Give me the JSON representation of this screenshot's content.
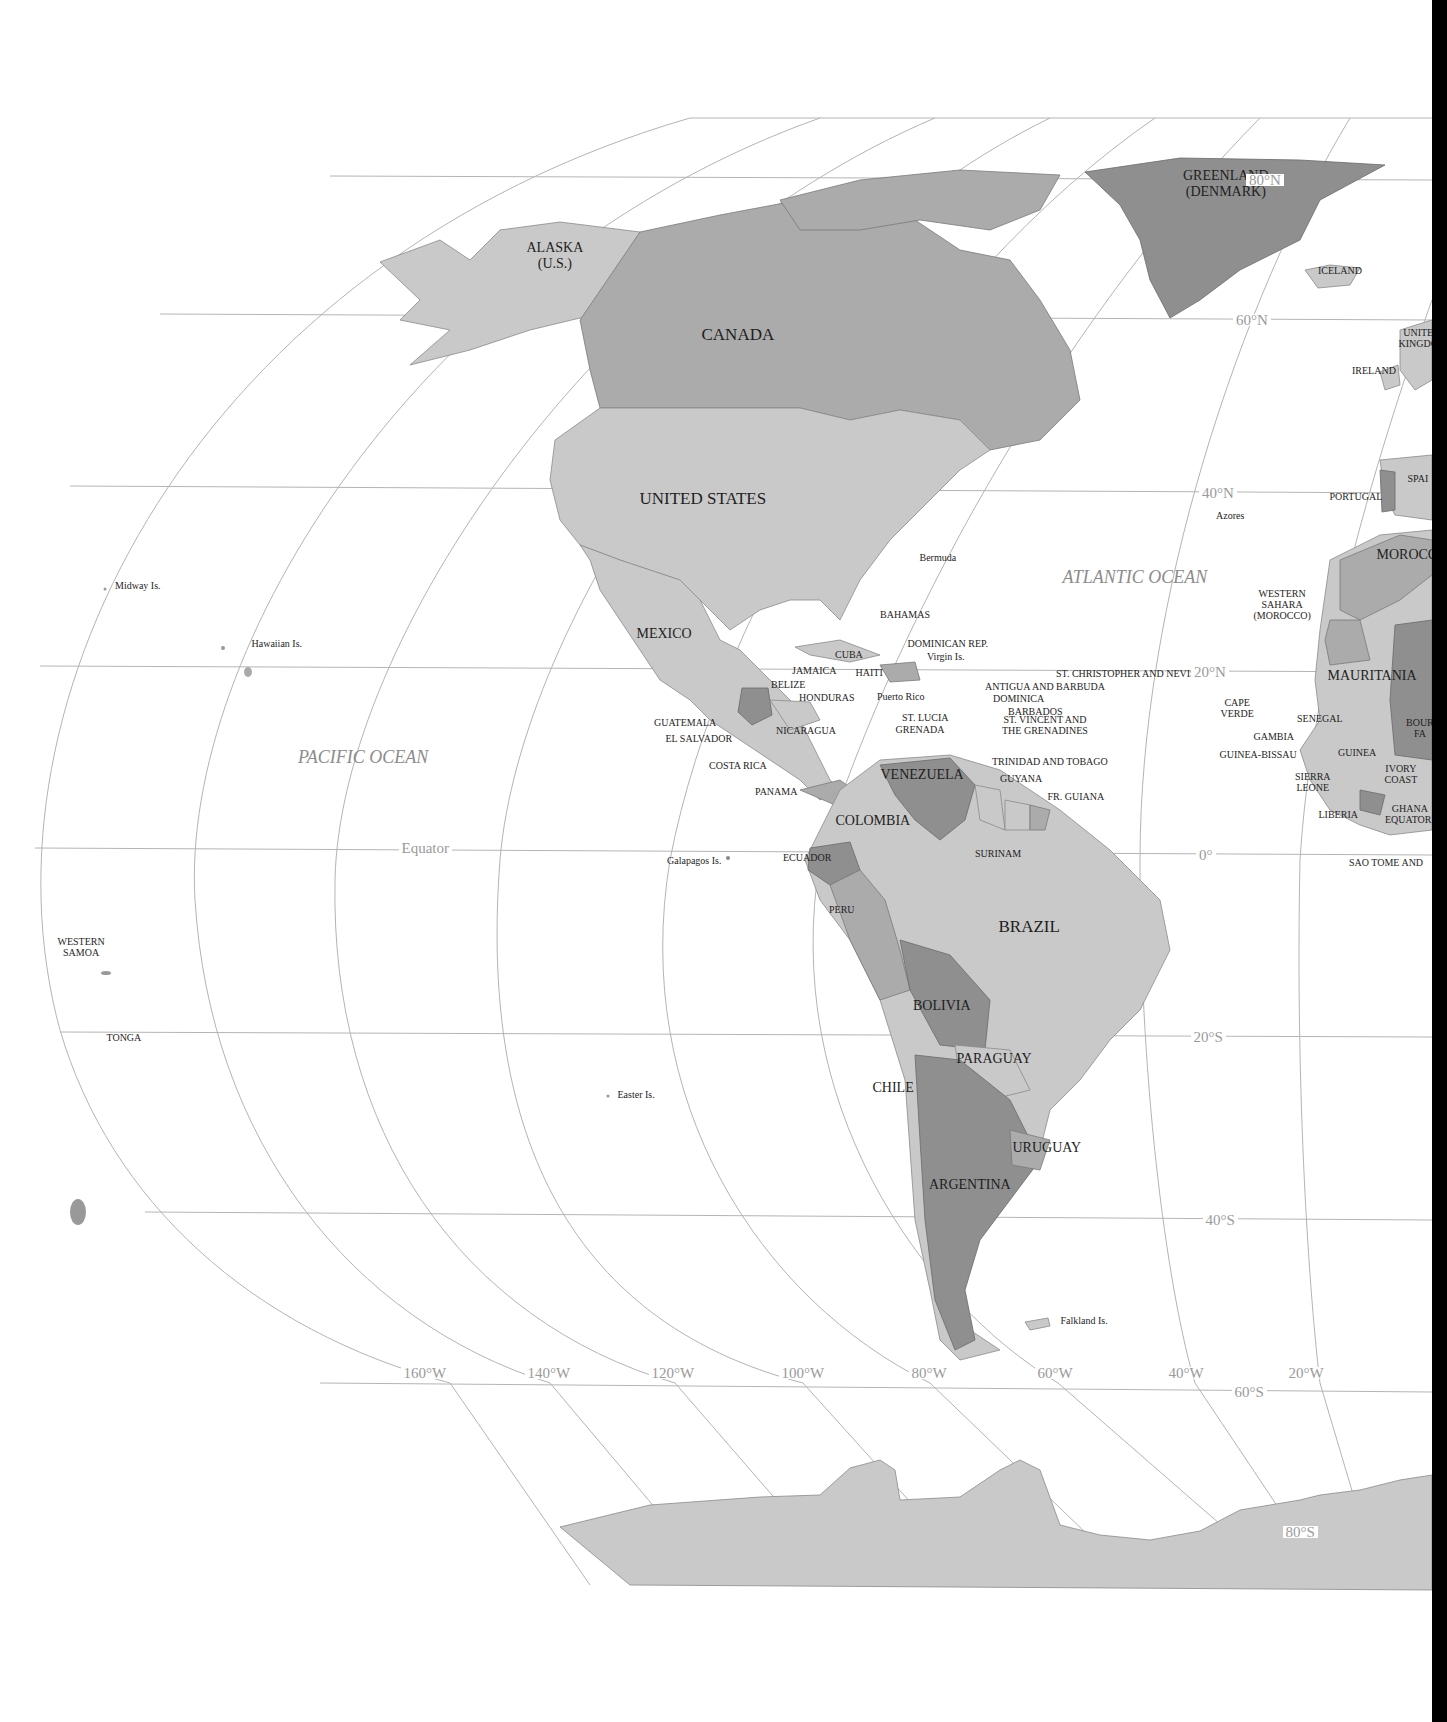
{
  "map": {
    "title": "Western Hemisphere political map",
    "colors": {
      "light": "#c9c9c9",
      "medium": "#ababab",
      "dark": "#8f8f8f",
      "grid": "#b4b4b4",
      "ocean_label": "#8c8c8c",
      "background": "#ffffff"
    },
    "oceans": [
      "PACIFIC OCEAN",
      "ATLANTIC OCEAN"
    ],
    "latitude_labels": [
      "80°N",
      "60°N",
      "40°N",
      "20°N",
      "Equator",
      "0°",
      "20°S",
      "40°S",
      "60°S",
      "80°S"
    ],
    "longitude_labels": [
      "160°W",
      "140°W",
      "120°W",
      "100°W",
      "80°W",
      "60°W",
      "40°W",
      "20°W"
    ],
    "countries": {
      "north_america": [
        "ALASKA\n(U.S.)",
        "CANADA",
        "UNITED STATES",
        "MEXICO",
        "GREENLAND\n(DENMARK)"
      ],
      "central_america": [
        "BELIZE",
        "HONDURAS",
        "GUATEMALA",
        "EL SALVADOR",
        "NICARAGUA",
        "COSTA RICA",
        "PANAMA"
      ],
      "caribbean": [
        "BAHAMAS",
        "CUBA",
        "JAMAICA",
        "HAITI",
        "DOMINICAN REP.",
        "Virgin Is.",
        "Puerto Rico",
        "ST. CHRISTOPHER AND NEVIS",
        "ANTIGUA AND BARBUDA",
        "DOMINICA",
        "BARBADOS",
        "ST. LUCIA",
        "GRENADA",
        "ST. VINCENT AND\nTHE GRENADINES",
        "TRINIDAD AND TOBAGO"
      ],
      "south_america": [
        "VENEZUELA",
        "GUYANA",
        "FR. GUIANA",
        "SURINAM",
        "COLOMBIA",
        "ECUADOR",
        "PERU",
        "BRAZIL",
        "BOLIVIA",
        "PARAGUAY",
        "CHILE",
        "URUGUAY",
        "ARGENTINA"
      ],
      "europe_africa": [
        "ICELAND",
        "UNITED\nKINGDOM",
        "IRELAND",
        "SPAIN",
        "PORTUGAL",
        "MOROCCO",
        "WESTERN\nSAHARA\n(MOROCCO)",
        "MAURITANIA",
        "CAPE\nVERDE",
        "SENEGAL",
        "GAMBIA",
        "GUINEA-BISSAU",
        "GUINEA",
        "BOURKINA\nFASO",
        "SIERRA\nLEONE",
        "LIBERIA",
        "IVORY\nCOAST",
        "GHANA",
        "EQUATORIAL",
        "SAO TOME AND"
      ]
    },
    "islands": [
      "Midway Is.",
      "Hawaiian Is.",
      "WESTERN\nSAMOA",
      "TONGA",
      "Galapagos Is.",
      "Easter Is.",
      "Falkland Is.",
      "Bermuda",
      "Azores"
    ],
    "labels": [
      {
        "id": "alaska",
        "t": "ALASKA",
        "t2": "(U.S.)",
        "x": 555,
        "y": 256,
        "cls": "med"
      },
      {
        "id": "canada",
        "t": "CANADA",
        "x": 738,
        "y": 334,
        "cls": "big"
      },
      {
        "id": "united-states",
        "t": "UNITED STATES",
        "x": 703,
        "y": 498,
        "cls": "big"
      },
      {
        "id": "mexico",
        "t": "MEXICO",
        "x": 664,
        "y": 634,
        "cls": "med"
      },
      {
        "id": "greenland",
        "t": "GREENLAND",
        "t2": "(DENMARK)",
        "x": 1226,
        "y": 184,
        "cls": "med"
      },
      {
        "id": "iceland",
        "t": "ICELAND",
        "x": 1340,
        "y": 270,
        "cls": "small"
      },
      {
        "id": "united-kingdom",
        "t": "UNITE",
        "t2": "KINGDO",
        "x": 1418,
        "y": 338,
        "cls": "small"
      },
      {
        "id": "ireland",
        "t": "IRELAND",
        "x": 1374,
        "y": 370,
        "cls": "small"
      },
      {
        "id": "spain",
        "t": "SPAI",
        "x": 1418,
        "y": 478,
        "cls": "small"
      },
      {
        "id": "portugal",
        "t": "PORTUGAL",
        "x": 1356,
        "y": 496,
        "cls": "small"
      },
      {
        "id": "morocco",
        "t": "MOROCCO",
        "x": 1412,
        "y": 555,
        "cls": "med"
      },
      {
        "id": "western-sahara",
        "t": "WESTERN",
        "t2": "SAHARA",
        "t3": "(MOROCCO)",
        "x": 1282,
        "y": 604,
        "cls": "small"
      },
      {
        "id": "mauritania",
        "t": "MAURITANIA",
        "x": 1372,
        "y": 676,
        "cls": "med"
      },
      {
        "id": "cape-verde",
        "t": "CAPE",
        "t2": "VERDE",
        "x": 1237,
        "y": 708,
        "cls": "small"
      },
      {
        "id": "senegal",
        "t": "SENEGAL",
        "x": 1320,
        "y": 718,
        "cls": "small"
      },
      {
        "id": "gambia",
        "t": "GAMBIA",
        "x": 1274,
        "y": 736,
        "cls": "small"
      },
      {
        "id": "guinea-bissau",
        "t": "GUINEA-BISSAU",
        "x": 1258,
        "y": 754,
        "cls": "small"
      },
      {
        "id": "guinea",
        "t": "GUINEA",
        "x": 1357,
        "y": 752,
        "cls": "small"
      },
      {
        "id": "bourkina-faso",
        "t": "BOUR",
        "t2": "FA",
        "x": 1420,
        "y": 728,
        "cls": "small"
      },
      {
        "id": "sierra-leone",
        "t": "SIERRA",
        "t2": "LEONE",
        "x": 1313,
        "y": 782,
        "cls": "small"
      },
      {
        "id": "ivory-coast",
        "t": "IVORY",
        "t2": "COAST",
        "x": 1401,
        "y": 774,
        "cls": "small"
      },
      {
        "id": "liberia",
        "t": "LIBERIA",
        "x": 1338,
        "y": 814,
        "cls": "small"
      },
      {
        "id": "ghana",
        "t": "GHANA",
        "t2": "EQUATORI",
        "x": 1410,
        "y": 814,
        "cls": "small"
      },
      {
        "id": "sao-tome",
        "t": "SAO TOME AND",
        "x": 1386,
        "y": 862,
        "cls": "small"
      },
      {
        "id": "bahamas",
        "t": "BAHAMAS",
        "x": 905,
        "y": 614,
        "cls": "small"
      },
      {
        "id": "cuba",
        "t": "CUBA",
        "x": 849,
        "y": 654,
        "cls": "small"
      },
      {
        "id": "dominican-rep",
        "t": "DOMINICAN REP.",
        "x": 948,
        "y": 643,
        "cls": "small"
      },
      {
        "id": "virgin-is",
        "t": "Virgin Is.",
        "x": 946,
        "y": 656,
        "cls": "small"
      },
      {
        "id": "jamaica",
        "t": "JAMAICA",
        "x": 814,
        "y": 670,
        "cls": "small"
      },
      {
        "id": "haiti",
        "t": "HAITI",
        "x": 869,
        "y": 672,
        "cls": "small"
      },
      {
        "id": "belize",
        "t": "BELIZE",
        "x": 788,
        "y": 684,
        "cls": "small"
      },
      {
        "id": "honduras",
        "t": "HONDURAS",
        "x": 827,
        "y": 697,
        "cls": "small"
      },
      {
        "id": "puerto-rico",
        "t": "Puerto Rico",
        "x": 901,
        "y": 696,
        "cls": "small"
      },
      {
        "id": "st-christopher",
        "t": "ST. CHRISTOPHER AND NEVIS",
        "x": 1056,
        "y": 673,
        "cls": "small",
        "left": true
      },
      {
        "id": "antigua",
        "t": "ANTIGUA AND BARBUDA",
        "x": 985,
        "y": 686,
        "cls": "small",
        "left": true
      },
      {
        "id": "dominica",
        "t": "DOMINICA",
        "x": 993,
        "y": 698,
        "cls": "small",
        "left": true
      },
      {
        "id": "barbados",
        "t": "BARBADOS",
        "x": 1008,
        "y": 711,
        "cls": "small",
        "left": true
      },
      {
        "id": "st-lucia",
        "t": "ST. LUCIA",
        "x": 925,
        "y": 717,
        "cls": "small"
      },
      {
        "id": "grenada",
        "t": "GRENADA",
        "x": 920,
        "y": 729,
        "cls": "small"
      },
      {
        "id": "st-vincent",
        "t": "ST. VINCENT AND",
        "t2": "THE GRENADINES",
        "x": 1045,
        "y": 725,
        "cls": "small"
      },
      {
        "id": "guatemala",
        "t": "GUATEMALA",
        "x": 685,
        "y": 722,
        "cls": "small"
      },
      {
        "id": "el-salvador",
        "t": "EL SALVADOR",
        "x": 699,
        "y": 738,
        "cls": "small"
      },
      {
        "id": "nicaragua",
        "t": "NICARAGUA",
        "x": 806,
        "y": 730,
        "cls": "small"
      },
      {
        "id": "costa-rica",
        "t": "COSTA RICA",
        "x": 738,
        "y": 765,
        "cls": "small"
      },
      {
        "id": "panama",
        "t": "PANAMA",
        "x": 776,
        "y": 791,
        "cls": "small"
      },
      {
        "id": "trinidad",
        "t": "TRINIDAD AND TOBAGO",
        "x": 1050,
        "y": 761,
        "cls": "small"
      },
      {
        "id": "venezuela",
        "t": "VENEZUELA",
        "x": 922,
        "y": 775,
        "cls": "med"
      },
      {
        "id": "guyana",
        "t": "GUYANA",
        "x": 1021,
        "y": 778,
        "cls": "small"
      },
      {
        "id": "fr-guiana",
        "t": "FR. GUIANA",
        "x": 1076,
        "y": 796,
        "cls": "small"
      },
      {
        "id": "colombia",
        "t": "COLOMBIA",
        "x": 873,
        "y": 821,
        "cls": "med"
      },
      {
        "id": "surinam",
        "t": "SURINAM",
        "x": 998,
        "y": 853,
        "cls": "small"
      },
      {
        "id": "ecuador",
        "t": "ECUADOR",
        "x": 807,
        "y": 857,
        "cls": "small"
      },
      {
        "id": "peru",
        "t": "PERU",
        "x": 842,
        "y": 909,
        "cls": "small"
      },
      {
        "id": "brazil",
        "t": "BRAZIL",
        "x": 1029,
        "y": 926,
        "cls": "big"
      },
      {
        "id": "bolivia",
        "t": "BOLIVIA",
        "x": 942,
        "y": 1006,
        "cls": "med"
      },
      {
        "id": "paraguay",
        "t": "PARAGUAY",
        "x": 994,
        "y": 1059,
        "cls": "med"
      },
      {
        "id": "chile",
        "t": "CHILE",
        "x": 893,
        "y": 1088,
        "cls": "med"
      },
      {
        "id": "uruguay",
        "t": "URUGUAY",
        "x": 1047,
        "y": 1148,
        "cls": "med"
      },
      {
        "id": "argentina",
        "t": "ARGENTINA",
        "x": 970,
        "y": 1185,
        "cls": "med"
      },
      {
        "id": "midway",
        "t": "Midway Is.",
        "x": 138,
        "y": 585,
        "cls": "small"
      },
      {
        "id": "hawaiian",
        "t": "Hawaiian Is.",
        "x": 277,
        "y": 643,
        "cls": "small"
      },
      {
        "id": "western-samoa",
        "t": "WESTERN",
        "t2": "SAMOA",
        "x": 81,
        "y": 947,
        "cls": "small"
      },
      {
        "id": "tonga",
        "t": "TONGA",
        "x": 124,
        "y": 1037,
        "cls": "small"
      },
      {
        "id": "galapagos",
        "t": "Galapagos Is.",
        "x": 694,
        "y": 860,
        "cls": "small"
      },
      {
        "id": "easter",
        "t": "Easter Is.",
        "x": 636,
        "y": 1094,
        "cls": "small"
      },
      {
        "id": "falkland",
        "t": "Falkland Is.",
        "x": 1084,
        "y": 1320,
        "cls": "small"
      },
      {
        "id": "bermuda",
        "t": "Bermuda",
        "x": 938,
        "y": 557,
        "cls": "small"
      },
      {
        "id": "azores",
        "t": "Azores",
        "x": 1230,
        "y": 515,
        "cls": "small"
      }
    ],
    "grid_labels": [
      {
        "t": "80°N",
        "x": 1265,
        "y": 180
      },
      {
        "t": "60°N",
        "x": 1252,
        "y": 320
      },
      {
        "t": "40°N",
        "x": 1218,
        "y": 493
      },
      {
        "t": "20°N",
        "x": 1210,
        "y": 672
      },
      {
        "t": "Equator",
        "x": 425,
        "y": 848
      },
      {
        "t": "0°",
        "x": 1206,
        "y": 855
      },
      {
        "t": "20°S",
        "x": 1208,
        "y": 1037
      },
      {
        "t": "40°S",
        "x": 1220,
        "y": 1220
      },
      {
        "t": "60°S",
        "x": 1249,
        "y": 1392
      },
      {
        "t": "80°S",
        "x": 1300,
        "y": 1532
      },
      {
        "t": "160°W",
        "x": 425,
        "y": 1373
      },
      {
        "t": "140°W",
        "x": 549,
        "y": 1373
      },
      {
        "t": "120°W",
        "x": 673,
        "y": 1373
      },
      {
        "t": "100°W",
        "x": 803,
        "y": 1373
      },
      {
        "t": "80°W",
        "x": 929,
        "y": 1373
      },
      {
        "t": "60°W",
        "x": 1055,
        "y": 1373
      },
      {
        "t": "40°W",
        "x": 1186,
        "y": 1373
      },
      {
        "t": "20°W",
        "x": 1306,
        "y": 1373
      }
    ],
    "ocean_labels": [
      {
        "t": "PACIFIC OCEAN",
        "x": 363,
        "y": 757
      },
      {
        "t": "ATLANTIC OCEAN",
        "x": 1135,
        "y": 577
      }
    ]
  }
}
